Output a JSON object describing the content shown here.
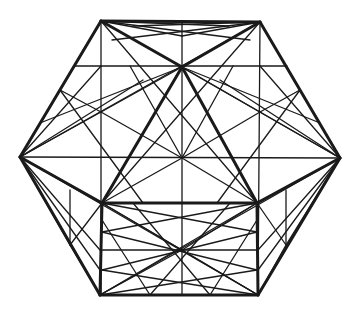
{
  "figure": {
    "stroke_color": "#1a1a1a",
    "background": "#ffffff",
    "vertices": {
      "TL": [
        101,
        21
      ],
      "TR": [
        260,
        22
      ],
      "L": [
        20,
        157
      ],
      "R": [
        340,
        158
      ],
      "BL": [
        100,
        295
      ],
      "BR": [
        258,
        295
      ],
      "A": [
        182,
        67
      ],
      "C": [
        182,
        158
      ],
      "IL": [
        102,
        203
      ],
      "IR": [
        257,
        203
      ],
      "TM": [
        182,
        36
      ]
    },
    "thick_lines": [
      [
        "TL",
        "TR"
      ],
      [
        "TR",
        "R"
      ],
      [
        "R",
        "BR"
      ],
      [
        "BR",
        "BL"
      ],
      [
        "BL",
        "L"
      ],
      [
        "L",
        "TL"
      ],
      [
        "TL",
        "A"
      ],
      [
        "TR",
        "A"
      ],
      [
        "A",
        "IL"
      ],
      [
        "A",
        "IR"
      ],
      [
        "IL",
        "IR"
      ],
      [
        "L",
        "IL"
      ],
      [
        "R",
        "IR"
      ],
      [
        "IL",
        "BL"
      ],
      [
        "IR",
        "BR"
      ]
    ],
    "thin_lines": [
      [
        [
          182,
          21
        ],
        [
          182,
          295
        ]
      ],
      [
        [
          20,
          157
        ],
        [
          340,
          158
        ]
      ],
      [
        [
          75,
          66
        ],
        [
          287,
          66
        ]
      ],
      [
        [
          101,
          21
        ],
        [
          101,
          295
        ]
      ],
      [
        [
          260,
          22
        ],
        [
          258,
          295
        ]
      ],
      [
        [
          102,
          250
        ],
        [
          257,
          250
        ]
      ],
      [
        [
          101,
          21
        ],
        [
          340,
          158
        ]
      ],
      [
        [
          260,
          22
        ],
        [
          20,
          157
        ]
      ],
      [
        [
          20,
          157
        ],
        [
          258,
          295
        ]
      ],
      [
        [
          340,
          158
        ],
        [
          100,
          295
        ]
      ],
      [
        [
          101,
          21
        ],
        [
          257,
          203
        ]
      ],
      [
        [
          260,
          22
        ],
        [
          102,
          203
        ]
      ],
      [
        [
          102,
          203
        ],
        [
          258,
          295
        ]
      ],
      [
        [
          257,
          203
        ],
        [
          100,
          295
        ]
      ],
      [
        [
          101,
          21
        ],
        [
          182,
          36
        ]
      ],
      [
        [
          260,
          22
        ],
        [
          182,
          36
        ]
      ],
      [
        [
          101,
          21
        ],
        [
          229,
          26
        ]
      ],
      [
        [
          260,
          22
        ],
        [
          133,
          26
        ]
      ],
      [
        [
          101,
          21
        ],
        [
          250,
          40
        ]
      ],
      [
        [
          260,
          22
        ],
        [
          112,
          40
        ]
      ],
      [
        [
          182,
          158
        ],
        [
          101,
          112
        ]
      ],
      [
        [
          182,
          158
        ],
        [
          260,
          112
        ]
      ],
      [
        [
          182,
          158
        ],
        [
          102,
          203
        ]
      ],
      [
        [
          182,
          158
        ],
        [
          257,
          203
        ]
      ],
      [
        [
          182,
          158
        ],
        [
          130,
          66
        ]
      ],
      [
        [
          182,
          158
        ],
        [
          233,
          66
        ]
      ],
      [
        [
          101,
          112
        ],
        [
          20,
          157
        ]
      ],
      [
        [
          260,
          112
        ],
        [
          340,
          158
        ]
      ],
      [
        [
          101,
          112
        ],
        [
          182,
          67
        ]
      ],
      [
        [
          260,
          112
        ],
        [
          182,
          67
        ]
      ],
      [
        [
          20,
          157
        ],
        [
          101,
          66
        ]
      ],
      [
        [
          340,
          158
        ],
        [
          260,
          66
        ]
      ],
      [
        [
          101,
          112
        ],
        [
          60,
          90
        ]
      ],
      [
        [
          260,
          112
        ],
        [
          300,
          90
        ]
      ],
      [
        [
          60,
          90
        ],
        [
          143,
          203
        ]
      ],
      [
        [
          300,
          90
        ],
        [
          217,
          203
        ]
      ],
      [
        [
          40,
          123
        ],
        [
          182,
          67
        ]
      ],
      [
        [
          320,
          123
        ],
        [
          182,
          67
        ]
      ],
      [
        [
          20,
          157
        ],
        [
          143,
          80
        ]
      ],
      [
        [
          340,
          158
        ],
        [
          220,
          80
        ]
      ],
      [
        [
          20,
          157
        ],
        [
          70,
          245
        ]
      ],
      [
        [
          340,
          158
        ],
        [
          286,
          245
        ]
      ],
      [
        [
          70,
          245
        ],
        [
          102,
          203
        ]
      ],
      [
        [
          286,
          245
        ],
        [
          257,
          203
        ]
      ],
      [
        [
          70,
          190
        ],
        [
          70,
          245
        ]
      ],
      [
        [
          286,
          190
        ],
        [
          286,
          245
        ]
      ],
      [
        [
          70,
          245
        ],
        [
          100,
          295
        ]
      ],
      [
        [
          286,
          245
        ],
        [
          258,
          295
        ]
      ],
      [
        [
          20,
          157
        ],
        [
          100,
          250
        ]
      ],
      [
        [
          340,
          158
        ],
        [
          258,
          250
        ]
      ],
      [
        [
          20,
          157
        ],
        [
          100,
          270
        ]
      ],
      [
        [
          340,
          158
        ],
        [
          258,
          270
        ]
      ],
      [
        [
          102,
          203
        ],
        [
          182,
          250
        ]
      ],
      [
        [
          257,
          203
        ],
        [
          182,
          250
        ]
      ],
      [
        [
          100,
          295
        ],
        [
          182,
          250
        ]
      ],
      [
        [
          258,
          295
        ],
        [
          182,
          250
        ]
      ],
      [
        [
          102,
          232
        ],
        [
          257,
          203
        ]
      ],
      [
        [
          257,
          232
        ],
        [
          102,
          203
        ]
      ],
      [
        [
          102,
          270
        ],
        [
          257,
          232
        ]
      ],
      [
        [
          257,
          270
        ],
        [
          102,
          232
        ]
      ],
      [
        [
          100,
          295
        ],
        [
          257,
          270
        ]
      ],
      [
        [
          258,
          295
        ],
        [
          102,
          270
        ]
      ],
      [
        [
          150,
          295
        ],
        [
          102,
          220
        ]
      ],
      [
        [
          210,
          295
        ],
        [
          257,
          220
        ]
      ],
      [
        [
          150,
          295
        ],
        [
          230,
          203
        ]
      ],
      [
        [
          210,
          295
        ],
        [
          133,
          203
        ]
      ]
    ]
  }
}
